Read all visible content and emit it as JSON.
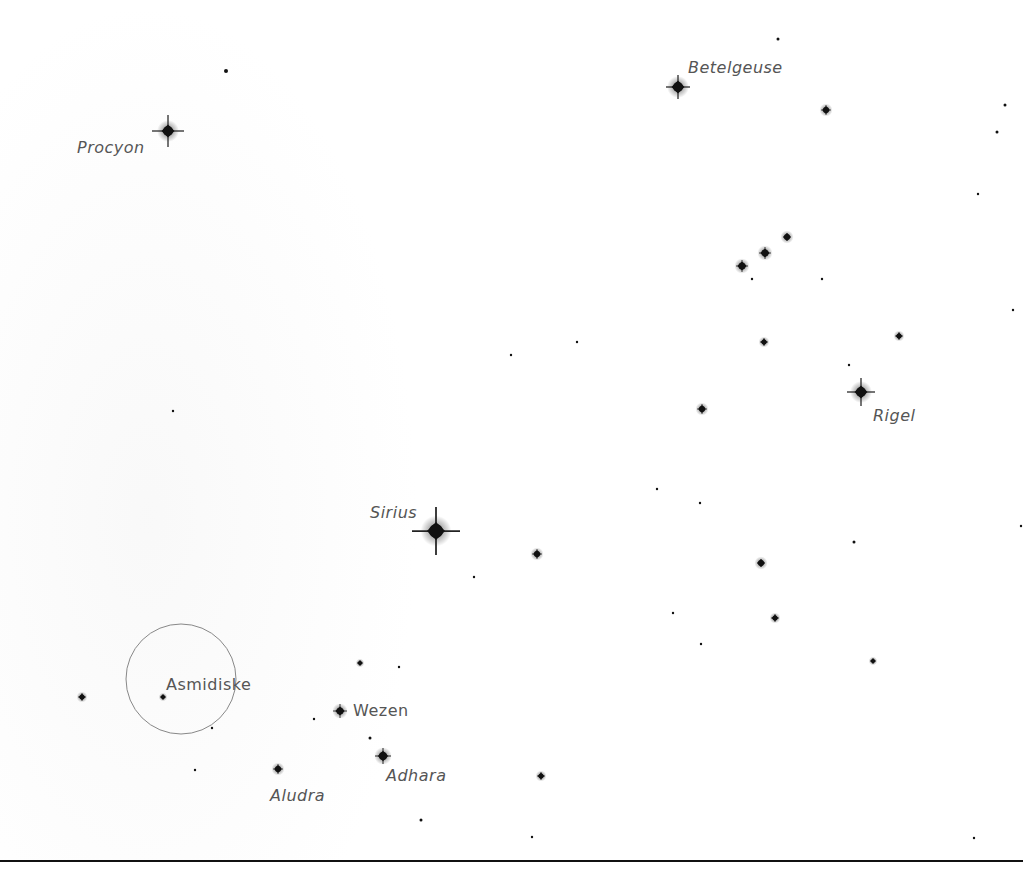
{
  "map": {
    "background": "#ffffff",
    "label_color": "#555555",
    "highlight_circle": {
      "label": "Asmidiske",
      "cx": 181,
      "cy": 679,
      "r": 55,
      "stroke": "#888888"
    },
    "labels": [
      {
        "name": "Procyon",
        "x": 77,
        "y": 140,
        "italic": true
      },
      {
        "name": "Betelgeuse",
        "x": 688,
        "y": 60,
        "italic": true
      },
      {
        "name": "Rigel",
        "x": 873,
        "y": 408,
        "italic": true
      },
      {
        "name": "Sirius",
        "x": 370,
        "y": 505,
        "italic": true
      },
      {
        "name": "Asmidiske",
        "x": 166,
        "y": 677,
        "italic": false
      },
      {
        "name": "Wezen",
        "x": 353,
        "y": 703,
        "italic": false
      },
      {
        "name": "Adhara",
        "x": 386,
        "y": 768,
        "italic": true
      },
      {
        "name": "Aludra",
        "x": 270,
        "y": 788,
        "italic": true
      }
    ],
    "stars": [
      {
        "x": 168,
        "y": 131,
        "size": 5,
        "flare": 16
      },
      {
        "x": 226,
        "y": 71,
        "size": 2,
        "flare": 0
      },
      {
        "x": 678,
        "y": 87,
        "size": 5,
        "flare": 12
      },
      {
        "x": 778,
        "y": 39,
        "size": 1.5,
        "flare": 0
      },
      {
        "x": 826,
        "y": 110,
        "size": 3,
        "flare": 5
      },
      {
        "x": 1005,
        "y": 105,
        "size": 1.5,
        "flare": 0
      },
      {
        "x": 997,
        "y": 132,
        "size": 1.5,
        "flare": 0
      },
      {
        "x": 978,
        "y": 194,
        "size": 1.2,
        "flare": 0
      },
      {
        "x": 787,
        "y": 237,
        "size": 3,
        "flare": 4
      },
      {
        "x": 765,
        "y": 253,
        "size": 3.5,
        "flare": 6
      },
      {
        "x": 742,
        "y": 266,
        "size": 3.5,
        "flare": 6
      },
      {
        "x": 752,
        "y": 279,
        "size": 1.2,
        "flare": 0
      },
      {
        "x": 822,
        "y": 279,
        "size": 1.2,
        "flare": 0
      },
      {
        "x": 1013,
        "y": 310,
        "size": 1.2,
        "flare": 0
      },
      {
        "x": 899,
        "y": 336,
        "size": 2.5,
        "flare": 4
      },
      {
        "x": 764,
        "y": 342,
        "size": 2.5,
        "flare": 4
      },
      {
        "x": 511,
        "y": 355,
        "size": 1.2,
        "flare": 0
      },
      {
        "x": 577,
        "y": 342,
        "size": 1.2,
        "flare": 0
      },
      {
        "x": 849,
        "y": 365,
        "size": 1.2,
        "flare": 0
      },
      {
        "x": 861,
        "y": 392,
        "size": 5,
        "flare": 14
      },
      {
        "x": 702,
        "y": 409,
        "size": 3,
        "flare": 5
      },
      {
        "x": 173,
        "y": 411,
        "size": 1.2,
        "flare": 0
      },
      {
        "x": 657,
        "y": 489,
        "size": 1.2,
        "flare": 0
      },
      {
        "x": 700,
        "y": 503,
        "size": 1.2,
        "flare": 0
      },
      {
        "x": 436,
        "y": 531,
        "size": 7,
        "flare": 24
      },
      {
        "x": 537,
        "y": 554,
        "size": 3,
        "flare": 5
      },
      {
        "x": 854,
        "y": 542,
        "size": 1.5,
        "flare": 0
      },
      {
        "x": 1021,
        "y": 526,
        "size": 1.2,
        "flare": 0
      },
      {
        "x": 761,
        "y": 563,
        "size": 3,
        "flare": 4
      },
      {
        "x": 474,
        "y": 577,
        "size": 1.2,
        "flare": 0
      },
      {
        "x": 673,
        "y": 613,
        "size": 1.2,
        "flare": 0
      },
      {
        "x": 775,
        "y": 618,
        "size": 2.5,
        "flare": 4
      },
      {
        "x": 701,
        "y": 644,
        "size": 1.2,
        "flare": 0
      },
      {
        "x": 873,
        "y": 661,
        "size": 2,
        "flare": 3
      },
      {
        "x": 360,
        "y": 663,
        "size": 2,
        "flare": 3
      },
      {
        "x": 399,
        "y": 667,
        "size": 1.2,
        "flare": 0
      },
      {
        "x": 82,
        "y": 697,
        "size": 2.5,
        "flare": 4
      },
      {
        "x": 163,
        "y": 697,
        "size": 2,
        "flare": 3
      },
      {
        "x": 212,
        "y": 728,
        "size": 1.2,
        "flare": 0
      },
      {
        "x": 340,
        "y": 711,
        "size": 3.5,
        "flare": 7
      },
      {
        "x": 314,
        "y": 719,
        "size": 1.2,
        "flare": 0
      },
      {
        "x": 370,
        "y": 738,
        "size": 1.5,
        "flare": 0
      },
      {
        "x": 383,
        "y": 756,
        "size": 4,
        "flare": 8
      },
      {
        "x": 278,
        "y": 769,
        "size": 3,
        "flare": 5
      },
      {
        "x": 195,
        "y": 770,
        "size": 1.2,
        "flare": 0
      },
      {
        "x": 541,
        "y": 776,
        "size": 2.5,
        "flare": 4
      },
      {
        "x": 421,
        "y": 820,
        "size": 1.5,
        "flare": 0
      },
      {
        "x": 532,
        "y": 837,
        "size": 1.2,
        "flare": 0
      },
      {
        "x": 974,
        "y": 838,
        "size": 1.2,
        "flare": 0
      }
    ]
  }
}
